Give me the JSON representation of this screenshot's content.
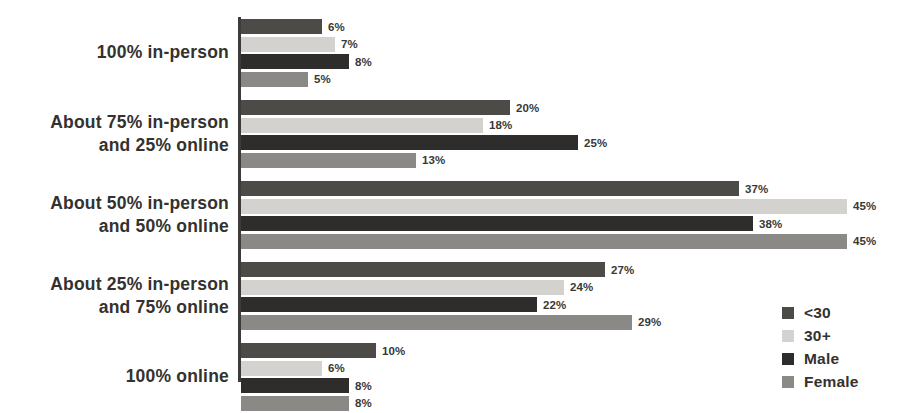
{
  "chart_data": {
    "type": "bar",
    "orientation": "horizontal",
    "title": "",
    "subtitle": "",
    "xlabel": "",
    "ylabel": "",
    "grid": false,
    "xlim": [
      0,
      50
    ],
    "value_suffix": "%",
    "legend_position": "bottom-right",
    "categories": [
      "100% in-person",
      "About 75% in-person and 25% online",
      "About 50% in-person and 50% online",
      "About 25% in-person and 75% online",
      "100% online"
    ],
    "category_lines": [
      [
        "100% in-person"
      ],
      [
        "About 75% in-person",
        "and 25% online"
      ],
      [
        "About 50% in-person",
        "and 50% online"
      ],
      [
        "About 25% in-person",
        "and 75% online"
      ],
      [
        "100% online"
      ]
    ],
    "series": [
      {
        "name": "<30",
        "color": "#4d4b48",
        "values": [
          6,
          20,
          37,
          27,
          10
        ],
        "labels": [
          "6%",
          "20%",
          "37%",
          "27%",
          "10%"
        ]
      },
      {
        "name": "30+",
        "color": "#d3d2cf",
        "values": [
          7,
          18,
          45,
          24,
          6
        ],
        "labels": [
          "7%",
          "18%",
          "45%",
          "24%",
          "6%"
        ]
      },
      {
        "name": "Male",
        "color": "#2f2d2b",
        "values": [
          8,
          25,
          38,
          22,
          8
        ],
        "labels": [
          "8%",
          "25%",
          "38%",
          "22%",
          "8%"
        ]
      },
      {
        "name": "Female",
        "color": "#8b8986",
        "values": [
          5,
          13,
          45,
          29,
          8
        ],
        "labels": [
          "5%",
          "13%",
          "45%",
          "29%",
          "8%"
        ]
      }
    ],
    "axis_color": "#3d3b39",
    "label_color": "#33322f"
  },
  "legend": {
    "items": [
      {
        "label": "<30",
        "color": "#4d4b48"
      },
      {
        "label": "30+",
        "color": "#d3d2cf"
      },
      {
        "label": "Male",
        "color": "#2f2d2b"
      },
      {
        "label": "Female",
        "color": "#8b8986"
      }
    ]
  }
}
